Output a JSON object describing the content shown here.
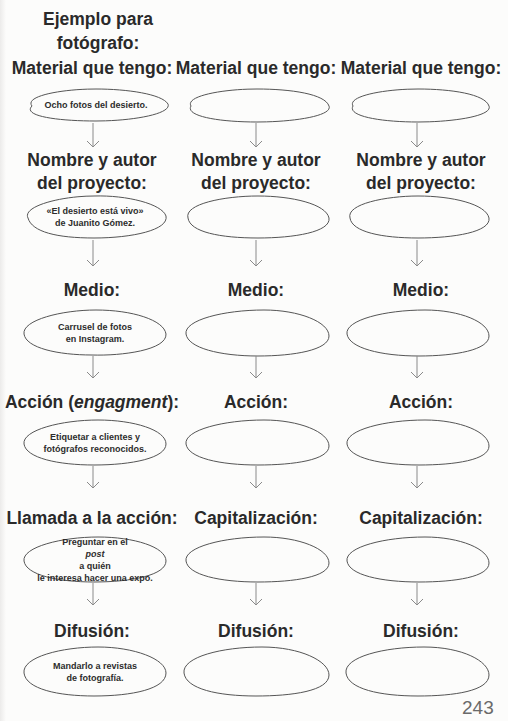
{
  "page": {
    "page_number": "243",
    "ink_color": "#2a2a2a",
    "line_color": "#555555",
    "arrow_color": "#8a8a8a"
  },
  "example_column": {
    "title_line1": "Ejemplo para",
    "title_line2": "fotógrafo:"
  },
  "columns": [
    {
      "steps": [
        {
          "heading_line1": "Material que tengo:",
          "heading_line2": "",
          "content_line1": "Ocho fotos del desierto.",
          "content_line2": ""
        },
        {
          "heading_line1": "Nombre y autor",
          "heading_line2": "del proyecto:",
          "content_line1": "«El desierto está vivo»",
          "content_line2": "de Juanito Gómez."
        },
        {
          "heading_line1": "Medio:",
          "heading_line2": "",
          "content_line1": "Carrusel de fotos",
          "content_line2": "en Instagram."
        },
        {
          "heading_line1": "Acción (",
          "heading_italic": "engagment",
          "heading_suffix": "):",
          "content_line1": "Etiquetar a clientes y",
          "content_line2": "fotógrafos reconocidos."
        },
        {
          "heading_line1": "Llamada a la acción:",
          "heading_line2": "",
          "content_prefix": "Preguntar en el ",
          "content_italic": "post",
          "content_suffix": " a quién",
          "content_line2": "le interesa hacer una expo."
        },
        {
          "heading_line1": "Difusión:",
          "heading_line2": "",
          "content_line1": "Mandarlo a revistas",
          "content_line2": "de fotografía."
        }
      ]
    },
    {
      "steps": [
        {
          "heading_line1": "Material que tengo:",
          "heading_line2": "",
          "content_line1": "",
          "content_line2": ""
        },
        {
          "heading_line1": "Nombre y autor",
          "heading_line2": "del proyecto:",
          "content_line1": "",
          "content_line2": ""
        },
        {
          "heading_line1": "Medio:",
          "heading_line2": "",
          "content_line1": "",
          "content_line2": ""
        },
        {
          "heading_line1": "Acción:",
          "heading_line2": "",
          "content_line1": "",
          "content_line2": ""
        },
        {
          "heading_line1": "Capitalización:",
          "heading_line2": "",
          "content_line1": "",
          "content_line2": ""
        },
        {
          "heading_line1": "Difusión:",
          "heading_line2": "",
          "content_line1": "",
          "content_line2": ""
        }
      ]
    },
    {
      "steps": [
        {
          "heading_line1": "Material que tengo:",
          "heading_line2": "",
          "content_line1": "",
          "content_line2": ""
        },
        {
          "heading_line1": "Nombre y autor",
          "heading_line2": "del proyecto:",
          "content_line1": "",
          "content_line2": ""
        },
        {
          "heading_line1": "Medio:",
          "heading_line2": "",
          "content_line1": "",
          "content_line2": ""
        },
        {
          "heading_line1": "Acción:",
          "heading_line2": "",
          "content_line1": "",
          "content_line2": ""
        },
        {
          "heading_line1": "Capitalización:",
          "heading_line2": "",
          "content_line1": "",
          "content_line2": ""
        },
        {
          "heading_line1": "Difusión:",
          "heading_line2": "",
          "content_line1": "",
          "content_line2": ""
        }
      ]
    }
  ]
}
